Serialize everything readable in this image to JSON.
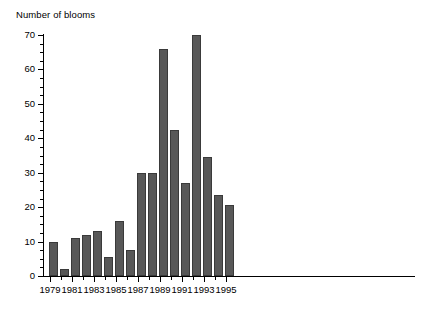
{
  "chart_data": {
    "type": "bar",
    "title": "",
    "ylabel": "Number of blooms",
    "xlabel": "",
    "ylim": [
      0,
      70
    ],
    "y_major_ticks": [
      0,
      10,
      20,
      30,
      40,
      50,
      60,
      70
    ],
    "y_minor_tick_step": 2.5,
    "grid": false,
    "legend": null,
    "bar_color": "#585858",
    "bar_edge_color": "#3a3a3a",
    "axis_color": "#000000",
    "background": "#ffffff",
    "categories": [
      "1979",
      "1980",
      "1981",
      "1982",
      "1983",
      "1984",
      "1985",
      "1986",
      "1987",
      "1988",
      "1989",
      "1990",
      "1991",
      "1992",
      "1993",
      "1994",
      "1995"
    ],
    "values": [
      10,
      2,
      11,
      12,
      13,
      5.5,
      16,
      7.5,
      30,
      30,
      66,
      42.5,
      27,
      70,
      34.5,
      23.5,
      20.5
    ],
    "x_tick_labels_shown": [
      "1979",
      "1981",
      "1983",
      "1985",
      "1987",
      "1989",
      "1991",
      "1993",
      "1995"
    ]
  },
  "axis": {
    "y_title": "Number of blooms",
    "y_tick_labels": [
      "70",
      "60",
      "50",
      "40",
      "30",
      "20",
      "10",
      "0"
    ],
    "x_tick_labels": [
      "1979",
      "1981",
      "1983",
      "1985",
      "1987",
      "1989",
      "1991",
      "1993",
      "1995"
    ]
  }
}
